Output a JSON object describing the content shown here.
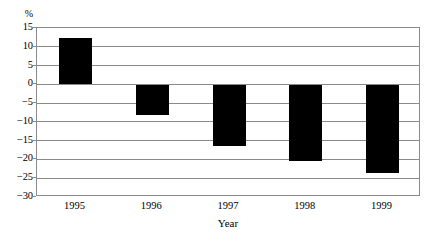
{
  "chart_data": {
    "type": "bar",
    "title": "",
    "subtitle": "",
    "categories": [
      "1995",
      "1996",
      "1997",
      "1998",
      "1999"
    ],
    "values": [
      12.3,
      -8.3,
      -16.3,
      -20.5,
      -23.6
    ],
    "xlabel": "Year",
    "ylabel": "%",
    "unit_label": "%",
    "ylim": [
      -30,
      15
    ],
    "ytick_step": 5,
    "yticks": [
      "15",
      "10",
      "5",
      "0",
      "−5",
      "−10",
      "−15",
      "−20",
      "−25",
      "−30"
    ],
    "ytick_values": [
      15,
      10,
      5,
      0,
      -5,
      -10,
      -15,
      -20,
      -25,
      -30
    ],
    "grid": true,
    "legend": "none",
    "bar_color": "#000000",
    "grid_color": "#8a8a8a",
    "background_color": "#ffffff"
  },
  "axis": {
    "x_title": "Year",
    "y_unit": "%"
  }
}
